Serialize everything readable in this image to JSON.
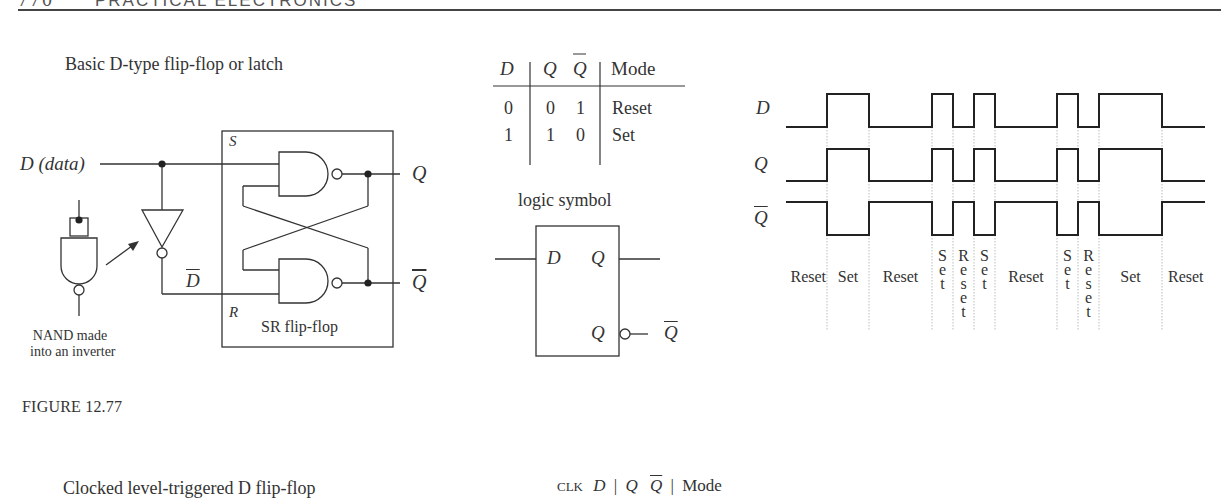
{
  "page_header": {
    "number": "770",
    "running_title": "PRACTICAL ELECTRONICS"
  },
  "figure_12_77": {
    "title": "Basic D-type flip-flop or latch",
    "circuit": {
      "input_label": "D (data)",
      "d_bar_label": "D",
      "s_label": "S",
      "r_label": "R",
      "q_label": "Q",
      "q_bar_label": "Q",
      "sr_box_label": "SR flip-flop",
      "nand_inverter_caption_line1": "NAND made",
      "nand_inverter_caption_line2": "into an inverter"
    },
    "truth_table": {
      "headers": [
        "D",
        "Q",
        "Q̄",
        "Mode"
      ],
      "rows": [
        [
          "0",
          "0",
          "1",
          "Reset"
        ],
        [
          "1",
          "1",
          "0",
          "Set"
        ]
      ]
    },
    "logic_symbol": {
      "title": "logic symbol",
      "pin_d": "D",
      "pin_q": "Q",
      "pin_q_inverted": "Q",
      "output_q_bar": "Q"
    },
    "timing_diagram": {
      "signals": [
        "D",
        "Q",
        "Q̄"
      ],
      "mode_labels": [
        "Reset",
        "Set",
        "Reset",
        "Set",
        "Reset",
        "Set",
        "Reset",
        "Set",
        "Reset",
        "Set",
        "Reset"
      ]
    },
    "label": "FIGURE 12.77"
  },
  "figure_next": {
    "title": "Clocked level-triggered D flip-flop",
    "truth_table_headers": [
      "CLK",
      "D",
      "Q",
      "Q̄",
      "Mode"
    ]
  },
  "chart_data": {
    "type": "timing",
    "x_edges": [
      786,
      827,
      869,
      932,
      953,
      974,
      995,
      1057,
      1078,
      1099,
      1162,
      1205
    ],
    "series": [
      {
        "name": "D",
        "values": [
          0,
          1,
          0,
          1,
          0,
          1,
          0,
          1,
          0,
          1,
          0
        ]
      },
      {
        "name": "Q",
        "values": [
          0,
          1,
          0,
          1,
          0,
          1,
          0,
          1,
          0,
          1,
          0
        ]
      },
      {
        "name": "Q̄",
        "values": [
          1,
          0,
          1,
          0,
          1,
          0,
          1,
          0,
          1,
          0,
          1
        ]
      }
    ],
    "segment_modes": [
      "Reset",
      "Set",
      "Reset",
      "Set",
      "Reset",
      "Set",
      "Reset",
      "Set",
      "Reset",
      "Set",
      "Reset"
    ]
  }
}
